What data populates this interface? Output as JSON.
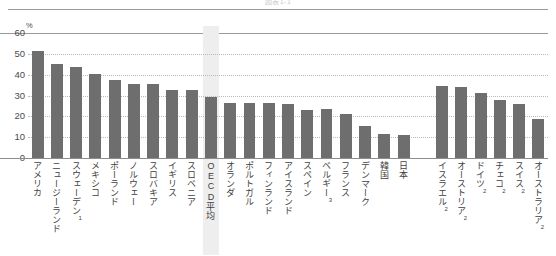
{
  "figure": {
    "top_note": "図表1-1",
    "y_unit": "%"
  },
  "chart_data": {
    "type": "bar",
    "title": "図表1-1",
    "xlabel": "",
    "ylabel": "%",
    "ylim": [
      0,
      60
    ],
    "yticks": [
      0,
      10,
      20,
      30,
      40,
      50,
      60
    ],
    "grid": true,
    "legend": "none",
    "highlight_category": "OECD平均",
    "bar_color": "#6e6e6e",
    "highlight_band_color": "#eeeeee",
    "categories": [
      "アメリカ",
      "ニュージーランド",
      "スウェーデン",
      "メキシコ",
      "ポーランド",
      "ノルウェー",
      "スロバキア",
      "イギリス",
      "スロベニア",
      "OECD平均",
      "オランダ",
      "ポルトガル",
      "フィンランド",
      "アイスランド",
      "スペイン",
      "ベルギー",
      "フランス",
      "デンマーク",
      "韓国",
      "日本",
      "",
      "イスラエル",
      "オーストリア",
      "ドイツ",
      "チェコ",
      "スイス",
      "オーストラリア"
    ],
    "category_notes": [
      "",
      "",
      "1",
      "",
      "",
      "",
      "",
      "",
      "",
      "",
      "",
      "",
      "",
      "",
      "",
      "3",
      "",
      "",
      "",
      "",
      "",
      "2",
      "2",
      "2",
      "2",
      "2",
      "2"
    ],
    "values": [
      51.5,
      45.0,
      43.5,
      40.5,
      37.5,
      35.5,
      35.3,
      32.8,
      32.6,
      29.5,
      26.5,
      26.3,
      26.2,
      25.8,
      23.0,
      23.3,
      21.3,
      15.5,
      11.5,
      11.0,
      null,
      34.5,
      34.0,
      31.0,
      28.0,
      26.0,
      18.5
    ]
  }
}
